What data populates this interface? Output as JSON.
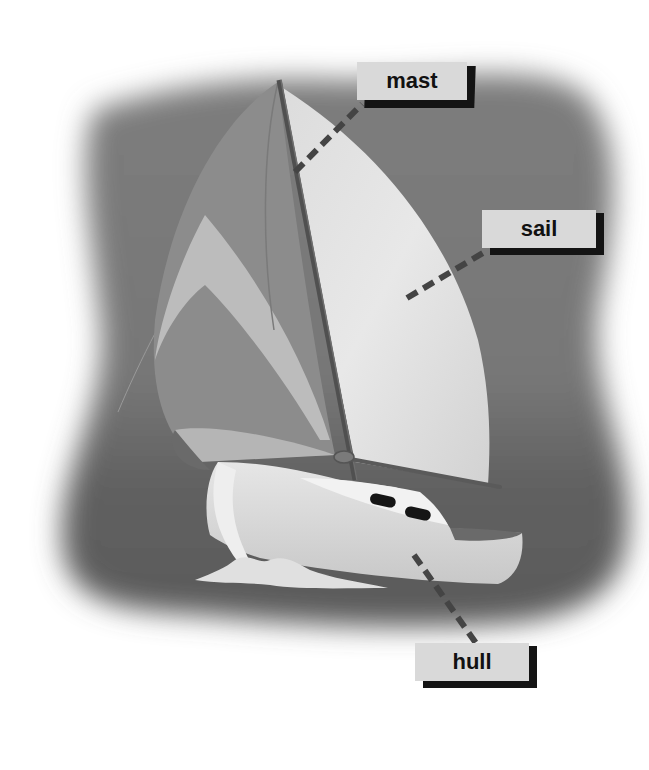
{
  "diagram": {
    "colors": {
      "page_background": "#ffffff",
      "vignette": "#7a7a7a",
      "sea": "#5c5c5c",
      "sail_light": "#e4e4e4",
      "sail_dark": "#8a8a8a",
      "sail_mid": "#b8b8b8",
      "hull": "#dedede",
      "mast": "#505050",
      "label_box": "#d9d9d9",
      "label_shadow": "#141414",
      "leader_line": "#444444"
    },
    "labels": [
      {
        "id": "mast",
        "text": "mast"
      },
      {
        "id": "sail",
        "text": "sail"
      },
      {
        "id": "hull",
        "text": "hull"
      }
    ]
  }
}
